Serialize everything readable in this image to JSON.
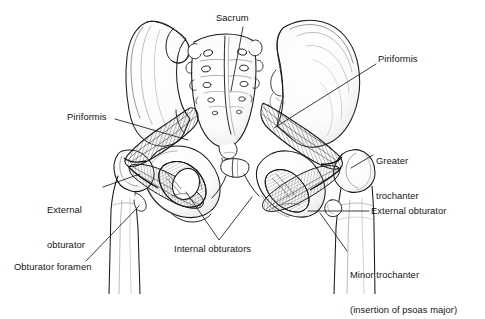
{
  "figure": {
    "background_color": "#ffffff",
    "ink_color": "#1a1a1a",
    "shade_color": "#8d8d8d",
    "width": 485,
    "height": 294
  },
  "labels": [
    {
      "id": "sacrum",
      "text": "Sacrum",
      "lines": [
        "Sacrum"
      ],
      "x": 216,
      "y": 12,
      "align": "left",
      "leader": {
        "from": [
          243,
          27
        ],
        "to": [
          231,
          91
        ]
      }
    },
    {
      "id": "piriformis-right",
      "text": "Piriformis",
      "lines": [
        "Piriformis"
      ],
      "x": 378,
      "y": 53,
      "align": "left",
      "leader": {
        "from": [
          376,
          64
        ],
        "to": [
          274,
          128
        ]
      }
    },
    {
      "id": "greater-trochanter",
      "text": "Greater trochanter",
      "lines": [
        "Greater",
        "trochanter"
      ],
      "x": 376,
      "y": 131,
      "align": "left",
      "leader": {
        "from": [
          373,
          155
        ],
        "to": [
          351,
          168
        ]
      }
    },
    {
      "id": "external-obturator-right",
      "text": "External obturator",
      "lines": [
        "External obturator"
      ],
      "x": 371,
      "y": 205,
      "align": "left",
      "leader": {
        "from": [
          369,
          211
        ],
        "to": [
          308,
          211
        ]
      }
    },
    {
      "id": "minor-trochanter",
      "text": "Minor trochanter (insertion of psoas major)",
      "lines": [
        "Minor trochanter",
        "(insertion of psoas major)"
      ],
      "x": 350,
      "y": 245,
      "align": "left",
      "leader": {
        "from": [
          347,
          251
        ],
        "to": [
          320,
          213
        ]
      }
    },
    {
      "id": "piriformis-left",
      "text": "Piriformis",
      "lines": [
        "Piriformis"
      ],
      "x": 67,
      "y": 111,
      "align": "left",
      "leader": {
        "from": [
          115,
          119
        ],
        "to": [
          188,
          140
        ]
      }
    },
    {
      "id": "external-obturator-left",
      "text": "External obturator",
      "lines": [
        "External",
        "obturator"
      ],
      "x": 47,
      "y": 180,
      "align": "left",
      "leader": {
        "from": [
          103,
          187
        ],
        "to": [
          140,
          174
        ]
      }
    },
    {
      "id": "obturator-foramen",
      "text": "Obturator foramen",
      "lines": [
        "Obturator foramen"
      ],
      "x": 14,
      "y": 261,
      "align": "left",
      "leader": {
        "from": [
          86,
          261
        ],
        "to": [
          139,
          206
        ]
      }
    },
    {
      "id": "internal-obturators",
      "text": "Internal obturators",
      "lines": [
        "Internal obturators"
      ],
      "x": 174,
      "y": 243,
      "align": "left",
      "leader_v": {
        "apex": [
          219,
          240
        ],
        "left": [
          186,
          192
        ],
        "right": [
          252,
          197
        ]
      }
    }
  ],
  "structures": {
    "sacrum": "sacrum",
    "ilium_left": "left-ilium",
    "ilium_right": "right-ilium",
    "femur_left": "left-femur",
    "femur_right": "right-femur",
    "piriformis_left": "left-piriformis-muscle",
    "piriformis_right": "right-piriformis-muscle",
    "obturator_internus": "internal-obturator-muscle",
    "obturator_externus": "external-obturator-muscle",
    "greater_trochanter": "greater-trochanter",
    "minor_trochanter": "minor-trochanter",
    "pubic_symphysis": "pubic-symphysis",
    "obturator_foramen": "obturator-foramen"
  }
}
